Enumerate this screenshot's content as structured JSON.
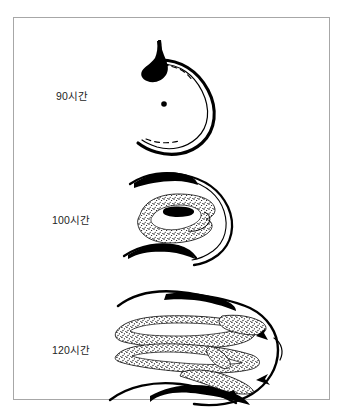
{
  "figure": {
    "kind": "scientific-illustration",
    "background_color": "#ffffff",
    "frame_color": "#a7a7a7",
    "ink_color": "#000000",
    "panels": [
      {
        "id": "stage-90",
        "label": "90시간",
        "description": "C-shaped outline opening left with solid black teardrop blob at upper left, single black dot at center, dashed inner contour"
      },
      {
        "id": "stage-100",
        "label": "100시간",
        "description": "C-shaped outline with tapered black bands top and bottom, stippled oval mass at center containing a solid black slot"
      },
      {
        "id": "stage-120",
        "label": "120시간",
        "description": "Broad rounded outline with black bands top and bottom, branching stippled interior structures, three solid black arrowhead wedges at right"
      }
    ]
  }
}
